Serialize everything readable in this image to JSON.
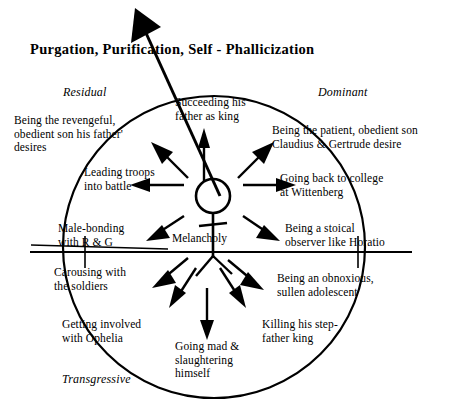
{
  "title": "Purgation,  Purification,  Self - Phallicization",
  "center": {
    "figure": "stick-figure",
    "label": "Melancholy"
  },
  "quadrants": {
    "residual": "Residual",
    "dominant": "Dominant",
    "transgressive": "Transgressive"
  },
  "options": [
    {
      "id": "revengeful-son",
      "text": "Being the revengeful,\nobedient son his father'\ndesires"
    },
    {
      "id": "succeeding-king",
      "text": "Succeeding his\nfather as king"
    },
    {
      "id": "patient-son",
      "text": "Being the patient, obedient son\nClaudius & Gertrude desire"
    },
    {
      "id": "college",
      "text": "Going back to college\nat Wittenberg"
    },
    {
      "id": "stoical-observer",
      "text": "Being a stoical\nobserver like Horatio"
    },
    {
      "id": "obnoxious-teen",
      "text": "Being an obnoxious,\nsullen adolescent"
    },
    {
      "id": "killing-king",
      "text": "Killing his step-\nfather king"
    },
    {
      "id": "going-mad",
      "text": "Going mad &\nslaughtering\nhimself"
    },
    {
      "id": "ophelia",
      "text": "Getting involved\nwith Ophelia"
    },
    {
      "id": "carousing",
      "text": "Carousing with\nthe soldiers"
    },
    {
      "id": "male-bonding",
      "text": "Male-bonding\nwith R & G"
    },
    {
      "id": "leading-troops",
      "text": "Leading troops\ninto battle"
    }
  ],
  "colors": {
    "ink": "#000000",
    "background": "#ffffff"
  }
}
